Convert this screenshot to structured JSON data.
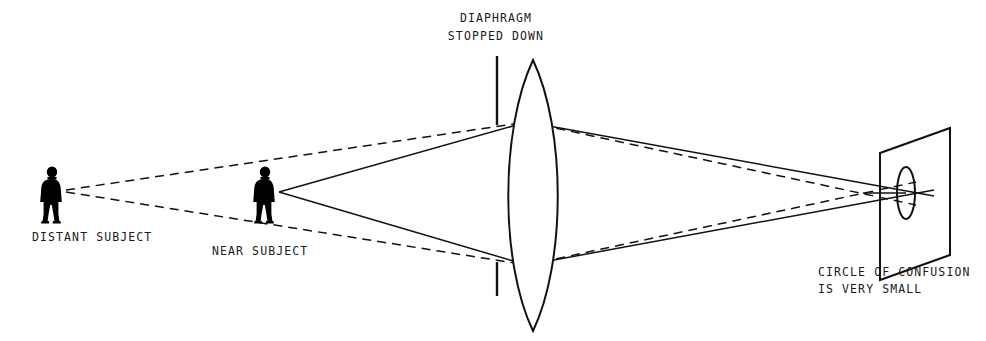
{
  "diagram": {
    "title_semantic": "depth-of-field-stopped-down-diagram",
    "stroke_color": "#111111",
    "fill_color": "#000000",
    "background_color": "#ffffff",
    "labels": {
      "diaphragm_line1": "DIAPHRAGM",
      "diaphragm_line2": "STOPPED DOWN",
      "distant_subject": "DISTANT SUBJECT",
      "near_subject": "NEAR SUBJECT",
      "circle_line1": "CIRCLE OF CONFUSION",
      "circle_line2": "IS VERY SMALL"
    },
    "elements": {
      "distant_subject_figure": "person-silhouette",
      "near_subject_figure": "person-silhouette",
      "lens": "biconvex-lens",
      "diaphragm_upper_blade": "vertical-line",
      "diaphragm_lower_blade": "vertical-line",
      "film_plane": "parallelogram",
      "circle_of_confusion": "ellipse",
      "near_subject_rays": "solid-lines",
      "distant_subject_rays": "dashed-lines"
    }
  }
}
